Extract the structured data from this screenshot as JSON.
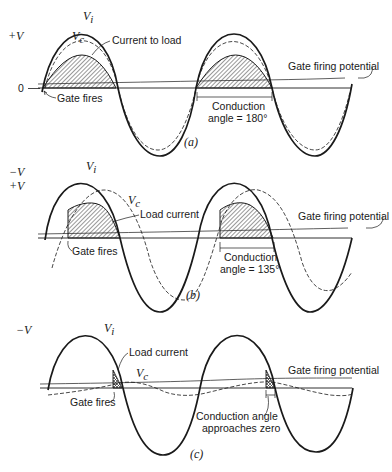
{
  "figure": {
    "panels": [
      {
        "id": "a",
        "label": "(a)",
        "axis_labels": {
          "positive": "+V",
          "zero": "0"
        },
        "curve_labels": {
          "input": "V",
          "input_sub": "i",
          "cap": "V",
          "cap_sub": "c"
        },
        "annotations": {
          "current": "Current to load",
          "gate_fires": "Gate fires",
          "gate_potential": "Gate firing potential",
          "conduction_line1": "Conduction",
          "conduction_line2": "angle = 180°"
        },
        "conduction_angle_deg": 180
      },
      {
        "id": "b",
        "label": "(b)",
        "axis_labels": {
          "negative": "−V",
          "positive": "+V"
        },
        "curve_labels": {
          "input": "V",
          "input_sub": "i",
          "cap": "V",
          "cap_sub": "c"
        },
        "annotations": {
          "current": "Load current",
          "gate_fires": "Gate fires",
          "gate_potential": "Gate firing potential",
          "conduction_line1": "Conduction",
          "conduction_line2": "angle = 135°"
        },
        "conduction_angle_deg": 135
      },
      {
        "id": "c",
        "label": "(c)",
        "axis_labels": {
          "negative": "−V"
        },
        "curve_labels": {
          "input": "V",
          "input_sub": "i",
          "cap": "V",
          "cap_sub": "c"
        },
        "annotations": {
          "current": "Load current",
          "gate_fires": "Gate fires",
          "gate_potential": "Gate firing potential",
          "conduction_line1": "Conduction angle",
          "conduction_line2": "approaches zero"
        },
        "conduction_angle_deg": 0
      }
    ],
    "colors": {
      "ink": "#1a1a1a",
      "background": "#ffffff"
    }
  }
}
